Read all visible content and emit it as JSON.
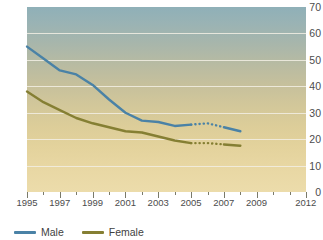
{
  "chart_data": {
    "type": "line",
    "title": "",
    "xlabel": "",
    "ylabel": "",
    "xlim": [
      1995,
      2012
    ],
    "ylim": [
      0,
      70
    ],
    "grid": true,
    "legend_position": "bottom-left",
    "y_ticks": [
      0,
      10,
      20,
      30,
      40,
      50,
      60,
      70
    ],
    "x_ticks": [
      1995,
      1996,
      1997,
      1998,
      1999,
      2000,
      2001,
      2002,
      2003,
      2004,
      2005,
      2006,
      2007,
      2008,
      2009,
      2010,
      2011,
      2012
    ],
    "x_tick_labels": [
      "1995",
      "",
      "1997",
      "",
      "1999",
      "",
      "2001",
      "",
      "2003",
      "",
      "2005",
      "",
      "2007",
      "",
      "2009",
      "",
      "",
      "2012"
    ],
    "series": [
      {
        "name": "Male",
        "color": "#4a82a6",
        "x": [
          1995,
          1996,
          1997,
          1998,
          1999,
          2000,
          2001,
          2002,
          2003,
          2004,
          2005,
          2006,
          2007,
          2008
        ],
        "values": [
          55.0,
          50.5,
          46.0,
          44.5,
          40.5,
          35.0,
          30.0,
          27.0,
          26.5,
          25.0,
          25.5,
          26.0,
          24.5,
          23.0
        ],
        "solid_to": 2005,
        "dotted_from": 2005,
        "dotted_to": 2007,
        "style_note": "solid 1995-2005, dotted 2005-2007, solid 2007-2008"
      },
      {
        "name": "Female",
        "color": "#857f33",
        "x": [
          1995,
          1996,
          1997,
          1998,
          1999,
          2000,
          2001,
          2002,
          2003,
          2004,
          2005,
          2006,
          2007,
          2008
        ],
        "values": [
          38.0,
          34.0,
          31.0,
          28.0,
          26.0,
          24.5,
          23.0,
          22.5,
          21.0,
          19.5,
          18.5,
          18.5,
          18.0,
          17.5
        ],
        "solid_to": 2005,
        "dotted_from": 2005,
        "dotted_to": 2007,
        "style_note": "solid 1995-2005, dotted 2005-2007, solid 2007-2008"
      }
    ]
  },
  "axes": {
    "y_labels": [
      "70",
      "60",
      "50",
      "40",
      "30",
      "20",
      "10",
      "0"
    ],
    "x_labels": [
      "1995",
      "1997",
      "1999",
      "2001",
      "2003",
      "2005",
      "2007",
      "2009",
      "2012"
    ]
  },
  "legend": {
    "items": [
      {
        "label": "Male",
        "color": "#4a82a6"
      },
      {
        "label": "Female",
        "color": "#857f33"
      }
    ]
  }
}
